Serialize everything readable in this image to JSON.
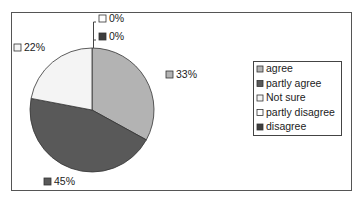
{
  "chart_data": {
    "type": "pie",
    "title": "",
    "slices": [
      {
        "label": "agree",
        "value": 33,
        "display": "33%",
        "color": "#b3b3b3"
      },
      {
        "label": "partly agree",
        "value": 45,
        "display": "45%",
        "color": "#595959"
      },
      {
        "label": "Not sure",
        "value": 22,
        "display": "22%",
        "color": "#f4f4f4"
      },
      {
        "label": "partly disagree",
        "value": 0,
        "display": "0%",
        "color": "#ffffff"
      },
      {
        "label": "disagree",
        "value": 0,
        "display": "0%",
        "color": "#3d3d3d"
      }
    ],
    "legend": {
      "placement": "right",
      "entries": [
        "agree",
        "partly agree",
        "Not sure",
        "partly disagree",
        "disagree"
      ]
    },
    "start_angle": "12 o'clock",
    "direction": "clockwise"
  }
}
